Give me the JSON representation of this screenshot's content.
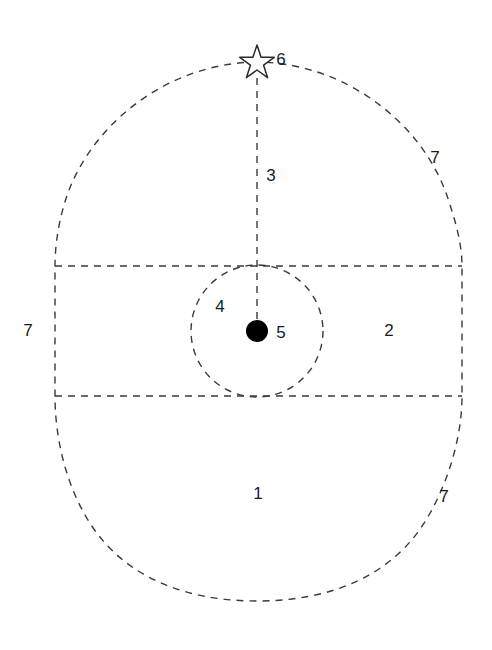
{
  "diagram": {
    "background_color": "#ffffff",
    "stroke_color": "#3a3a3a",
    "label_color": "#1a1a1a",
    "marker_fill_color": "#000000",
    "stroke_style": "dashed",
    "stroke_width": 1.4,
    "dash_pattern": "7 6"
  },
  "shapes": {
    "outer_oval": {
      "name": "outer-oval",
      "description": "egg-shaped dashed outline, flattened at left and right between the band lines",
      "center_x": 257,
      "center_y": 333,
      "top_y": 62,
      "bottom_y": 601,
      "left_x": 55,
      "right_x": 462
    },
    "band": {
      "name": "horizontal-band",
      "description": "horizontal dashed band spanning the oval width",
      "top_y": 266,
      "bottom_y": 396,
      "left_x": 55,
      "right_x": 462
    },
    "inner_circle": {
      "name": "inner-circle",
      "description": "dashed circle tangent to both band lines",
      "center_x": 257,
      "center_y": 331,
      "radius": 66
    },
    "center_dot": {
      "name": "center-dot",
      "description": "solid black filled circle marking the center point",
      "center_x": 257,
      "center_y": 331,
      "radius": 11
    },
    "apex_star": {
      "name": "apex-star",
      "description": "unfilled five-pointed star outline at the top of the oval",
      "center_x": 257,
      "center_y": 62,
      "outer_radius": 17,
      "inner_radius": 7
    },
    "axis_line": {
      "name": "vertical-axis-line",
      "description": "vertical dashed line from the star down to the center dot",
      "x": 257,
      "top_y": 78,
      "bottom_y": 331
    }
  },
  "labels": [
    {
      "id": "label-1",
      "name": "zone-label-1",
      "text": "1",
      "x": 258,
      "y": 493
    },
    {
      "id": "label-2",
      "name": "zone-label-2",
      "text": "2",
      "x": 389,
      "y": 330
    },
    {
      "id": "label-3",
      "name": "zone-label-3",
      "text": "3",
      "x": 271,
      "y": 175
    },
    {
      "id": "label-4",
      "name": "zone-label-4",
      "text": "4",
      "x": 220,
      "y": 306
    },
    {
      "id": "label-5",
      "name": "zone-label-5",
      "text": "5",
      "x": 281,
      "y": 332
    },
    {
      "id": "label-6",
      "name": "zone-label-6",
      "text": "6",
      "x": 281,
      "y": 59
    },
    {
      "id": "label-7-upper-right",
      "name": "zone-label-7-upper-right",
      "text": "7",
      "x": 435,
      "y": 157
    },
    {
      "id": "label-7-left",
      "name": "zone-label-7-left",
      "text": "7",
      "x": 28,
      "y": 330
    },
    {
      "id": "label-7-lower-right",
      "name": "zone-label-7-lower-right",
      "text": "7",
      "x": 444,
      "y": 496
    }
  ]
}
